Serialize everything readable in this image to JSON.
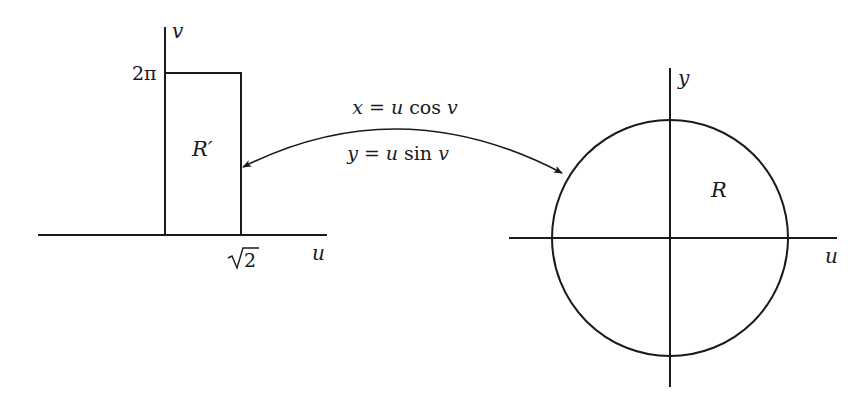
{
  "diagram": {
    "type": "coordinate-transformation",
    "left_plane": {
      "horizontal_axis_label": "u",
      "vertical_axis_label": "v",
      "region_label": "R′",
      "region_shape": "rectangle",
      "u_bound_label": "√2",
      "v_bound_label": "2π",
      "u_bound_radicand": "2",
      "v_bound_value": "2π"
    },
    "right_plane": {
      "horizontal_axis_label": "u",
      "vertical_axis_label": "y",
      "region_label": "R",
      "region_shape": "disk"
    },
    "mapping": {
      "equation_x": {
        "lhs": "x",
        "eq": "=",
        "var": "u",
        "fn": "cos",
        "arg": "v"
      },
      "equation_y": {
        "lhs": "y",
        "eq": "=",
        "var": "u",
        "fn": "sin",
        "arg": "v"
      },
      "arrow": "double-headed curved arrow between R′ and R"
    },
    "colors": {
      "ink": "#1a1a1a",
      "background": "#ffffff"
    }
  }
}
